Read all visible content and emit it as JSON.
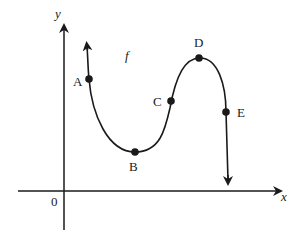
{
  "diagram": {
    "type": "function-graph",
    "function_label": "f",
    "axes": {
      "x_label": "x",
      "y_label": "y",
      "origin_label": "0"
    },
    "points": [
      {
        "label": "A",
        "description": "on decreasing part near left end"
      },
      {
        "label": "B",
        "description": "local minimum"
      },
      {
        "label": "C",
        "description": "on increasing part"
      },
      {
        "label": "D",
        "description": "local maximum"
      },
      {
        "label": "E",
        "description": "on decreasing part after maximum"
      }
    ],
    "colors": {
      "line": "#1a1a1a",
      "background": "#ffffff"
    }
  }
}
